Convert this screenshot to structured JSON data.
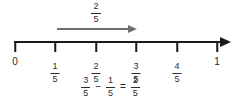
{
  "top_arrow": {
    "label": {
      "num": "2",
      "den": "5"
    }
  },
  "number_line": {
    "range_start": "0",
    "range_end": "1",
    "tick_labels": [
      {
        "type": "plain",
        "text": "0"
      },
      {
        "type": "frac",
        "num": "1",
        "den": "5"
      },
      {
        "type": "frac",
        "num": "2",
        "den": "5"
      },
      {
        "type": "frac",
        "num": "3",
        "den": "5"
      },
      {
        "type": "frac",
        "num": "4",
        "den": "5"
      },
      {
        "type": "plain",
        "text": "1"
      }
    ]
  },
  "equation": {
    "term1": {
      "num": "3",
      "den": "5"
    },
    "operator": "−",
    "term2": {
      "num": "1",
      "den": "5"
    },
    "equals": "=",
    "result": {
      "num": "2",
      "den": "5"
    }
  },
  "colors": {
    "number_line": "#1a1a1a",
    "jump_arrow": "#6f6f6f",
    "text": "#2b2b2b"
  }
}
